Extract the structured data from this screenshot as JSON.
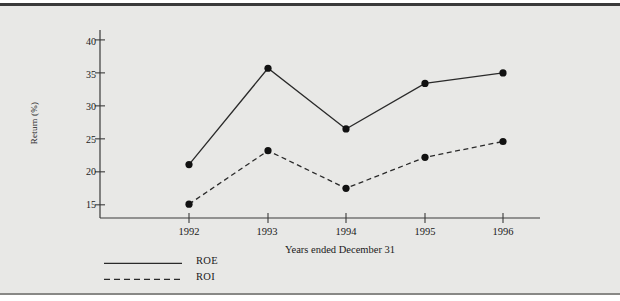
{
  "chart_data": {
    "type": "line",
    "title": "",
    "subtitle": "",
    "xlabel": "Years ended December 31",
    "ylabel": "Return (%)",
    "categories": [
      "1992",
      "1993",
      "1994",
      "1995",
      "1996"
    ],
    "x": [
      1992,
      1993,
      1994,
      1995,
      1996
    ],
    "series": [
      {
        "name": "ROE",
        "style": "solid",
        "marker": "filled-circle",
        "values": [
          21.1,
          35.7,
          26.5,
          33.4,
          35.0
        ]
      },
      {
        "name": "ROI",
        "style": "dashed",
        "marker": "filled-circle",
        "values": [
          15.1,
          23.2,
          17.5,
          22.2,
          24.6
        ]
      }
    ],
    "ylim": [
      13.0,
      41.5
    ],
    "yticks": [
      15,
      20,
      25,
      30,
      35,
      40
    ],
    "ytick_labels": [
      "15",
      "20",
      "25",
      "30",
      "35",
      "40"
    ],
    "xtick_labels": [
      "1992",
      "1993",
      "1994",
      "1995",
      "1996"
    ],
    "grid": false,
    "legend_position": "below-left",
    "legend_entries": [
      "ROE",
      "ROI"
    ]
  },
  "colors": {
    "background": "#e8e8e6",
    "page": "#ffffff",
    "line": "#2a2a2a",
    "marker": "#111111",
    "axis": "#3a3a3a",
    "text": "#1a1a1a",
    "frame_top": "#3a3a3a",
    "frame_bottom": "#888886"
  },
  "axis_label_x": "Years ended December 31",
  "axis_label_y": "Return (%)",
  "ytick_0": "15",
  "ytick_1": "20",
  "ytick_2": "25",
  "ytick_3": "30",
  "ytick_4": "35",
  "ytick_5": "40",
  "xtick_0": "1992",
  "xtick_1": "1993",
  "xtick_2": "1994",
  "xtick_3": "1995",
  "xtick_4": "1996",
  "legend_0": "ROE",
  "legend_1": "ROI"
}
